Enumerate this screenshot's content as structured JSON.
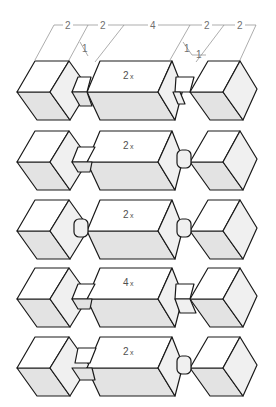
{
  "diagram": {
    "type": "isometric joinery assemblies",
    "dimensions": {
      "top": [
        "2",
        "2",
        "4",
        "2",
        "2"
      ],
      "joint_offsets": [
        "1",
        "1",
        "1"
      ]
    },
    "rows": [
      {
        "middle_label_num": "2",
        "middle_label_x": "x",
        "left_joint": "half-lap",
        "right_joint": "dovetail-lap"
      },
      {
        "middle_label_num": "2",
        "middle_label_x": "x",
        "left_joint": "dovetail",
        "right_joint": "round-tenon"
      },
      {
        "middle_label_num": "2",
        "middle_label_x": "x",
        "left_joint": "round-tenon",
        "right_joint": "round-tenon"
      },
      {
        "middle_label_num": "4",
        "middle_label_x": "x",
        "left_joint": "dovetail",
        "right_joint": "half-lap"
      },
      {
        "middle_label_num": "2",
        "middle_label_x": "x",
        "left_joint": "dovetail-lap",
        "right_joint": "round-tenon"
      }
    ],
    "colors": {
      "outline": "#1a1a1a",
      "top_face": "#ffffff",
      "side_face": "#f0f0f0",
      "front_face": "#e3e3e3",
      "dimension_line": "#8a8a8a"
    }
  }
}
